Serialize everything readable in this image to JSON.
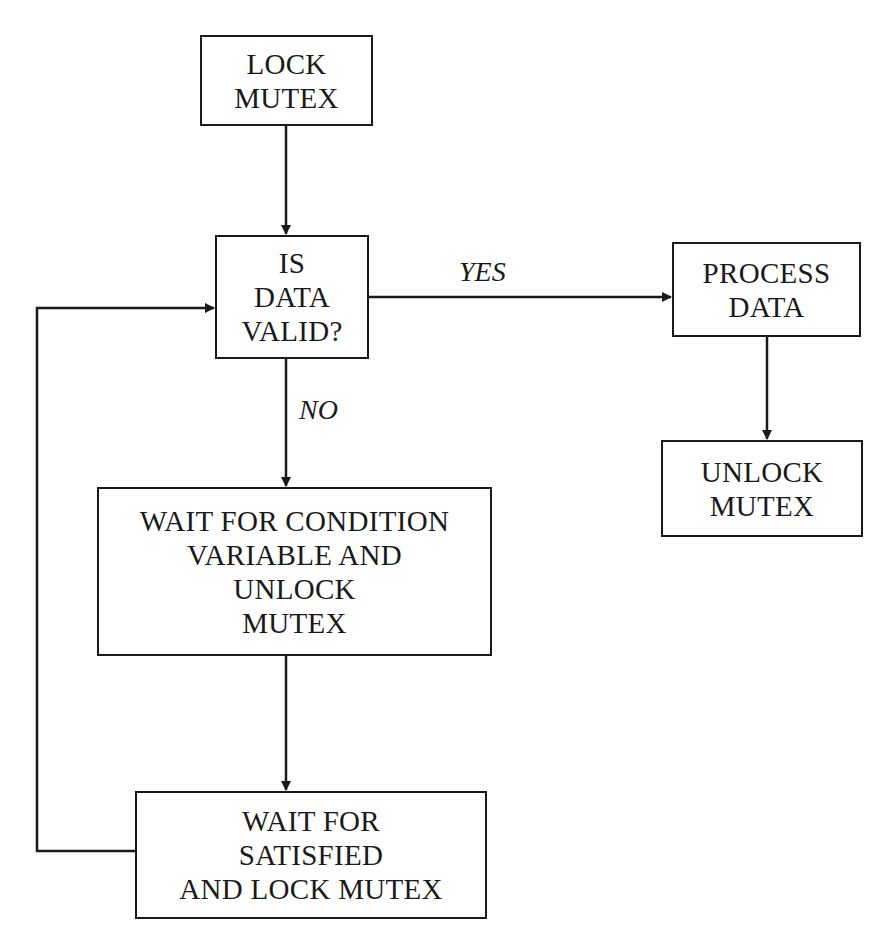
{
  "diagram": {
    "type": "flowchart",
    "nodes": {
      "lock_mutex": {
        "lines": [
          "LOCK",
          "MUTEX"
        ]
      },
      "is_data_valid": {
        "lines": [
          "IS",
          "DATA",
          "VALID?"
        ]
      },
      "process_data": {
        "lines": [
          "PROCESS",
          "DATA"
        ]
      },
      "unlock_mutex": {
        "lines": [
          "UNLOCK",
          "MUTEX"
        ]
      },
      "wait_condition": {
        "lines": [
          "WAIT FOR CONDITION",
          "VARIABLE AND",
          "UNLOCK",
          "MUTEX"
        ]
      },
      "wait_satisfied": {
        "lines": [
          "WAIT FOR",
          "SATISFIED",
          "AND LOCK MUTEX"
        ]
      }
    },
    "edge_labels": {
      "yes": "YES",
      "no": "NO"
    },
    "edges": [
      {
        "from": "lock_mutex",
        "to": "is_data_valid"
      },
      {
        "from": "is_data_valid",
        "to": "process_data",
        "label": "YES"
      },
      {
        "from": "is_data_valid",
        "to": "wait_condition",
        "label": "NO"
      },
      {
        "from": "process_data",
        "to": "unlock_mutex"
      },
      {
        "from": "wait_condition",
        "to": "wait_satisfied"
      },
      {
        "from": "wait_satisfied",
        "to": "is_data_valid"
      }
    ]
  }
}
